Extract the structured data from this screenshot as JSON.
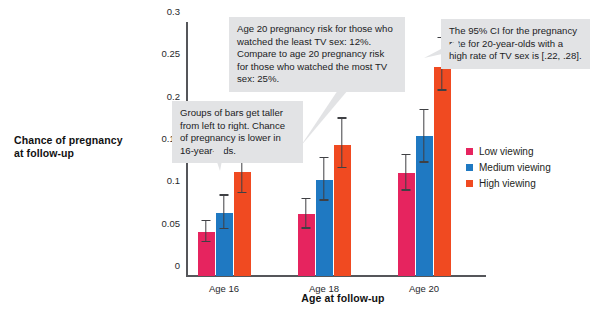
{
  "chart_data": {
    "type": "bar",
    "title": "",
    "xlabel": "Age at follow-up",
    "ylabel": "Chance of pregnancy at follow-up",
    "categories": [
      "Age 16",
      "Age 18",
      "Age 20"
    ],
    "ylim": [
      0,
      0.3
    ],
    "yticks": [
      "0",
      "0.05",
      "0.1",
      "0.15",
      "0.2",
      "0.25",
      "0.3"
    ],
    "ytick_values": [
      0,
      0.05,
      0.1,
      0.15,
      0.2,
      0.25,
      0.3
    ],
    "grid": false,
    "legend_position": "right",
    "errorbars": "95% CI",
    "series": [
      {
        "name": "Low viewing",
        "color": "#e6245f",
        "values": [
          0.052,
          0.073,
          0.122
        ],
        "ci_low": [
          0.04,
          0.056,
          0.101
        ],
        "ci_high": [
          0.065,
          0.091,
          0.143
        ]
      },
      {
        "name": "Medium viewing",
        "color": "#1f79c2",
        "values": [
          0.074,
          0.113,
          0.165
        ],
        "ci_low": [
          0.055,
          0.089,
          0.134
        ],
        "ci_high": [
          0.095,
          0.139,
          0.196
        ]
      },
      {
        "name": "High viewing",
        "color": "#f04a21",
        "values": [
          0.123,
          0.155,
          0.247
        ],
        "ci_low": [
          0.098,
          0.127,
          0.219
        ],
        "ci_high": [
          0.15,
          0.186,
          0.281
        ]
      }
    ]
  },
  "annotations": [
    {
      "id": "callout-age20-comparison",
      "text": "Age 20 pregnancy risk for those who watched the least TV sex: 12%. Compare to age 20 pregnancy risk for those who watched the most TV sex: 25%."
    },
    {
      "id": "callout-groups-trend",
      "text": "Groups of bars get taller from left to right. Chance of pregnancy is lower in 16-year-olds."
    },
    {
      "id": "callout-confidence-interval",
      "text": "The 95% CI for the pregnancy rate for 20-year-olds with a high rate of TV sex is [.22, .28]."
    }
  ],
  "colors": {
    "low": "#e6245f",
    "medium": "#1f79c2",
    "high": "#f04a21",
    "axis": "#55565a",
    "callout_background": "#e2e3e5",
    "text": "#1b1c1e"
  }
}
